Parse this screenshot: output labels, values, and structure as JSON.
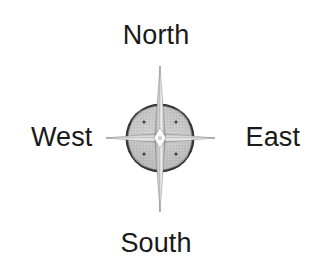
{
  "figure": {
    "type": "compass-rose-diagram",
    "width": 312,
    "height": 271,
    "background_color": "#ffffff",
    "title": ""
  },
  "labels": {
    "north": "North",
    "east": "East",
    "south": "South",
    "west": "West"
  },
  "compass": {
    "center_x": 160,
    "center_y": 138,
    "circle_diameter": 70,
    "ring_color": "#333333",
    "disc_fill_color": "#a8a8a8",
    "wedge_color": "#c8c8c8",
    "star_light_color": "#ffffff",
    "star_shade_color": "#8d8d8d",
    "star_outline_color": "#6e6e6e",
    "dot_color": "#3a3a3a",
    "star_vertical_top": 66,
    "star_vertical_bottom": 212,
    "star_horizontal_left": 106,
    "star_horizontal_right": 215,
    "point_count": 4
  },
  "colors": {
    "text": "#1a1a1a",
    "background": "#ffffff"
  }
}
